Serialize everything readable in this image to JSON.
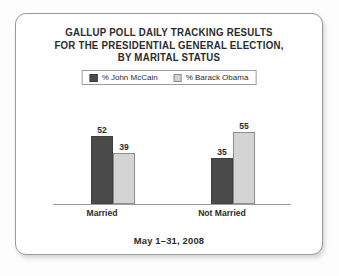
{
  "chart_data": {
    "type": "bar",
    "title": "GALLUP POLL DAILY TRACKING RESULTS FOR THE PRESIDENTIAL GENERAL ELECTION, BY MARITAL STATUS",
    "title_lines": [
      "GALLUP POLL DAILY TRACKING RESULTS",
      "FOR THE PRESIDENTIAL GENERAL ELECTION,",
      "BY MARITAL STATUS"
    ],
    "subtitle": "May 1–31, 2008",
    "categories": [
      "Married",
      "Not Married"
    ],
    "series": [
      {
        "name": "% John McCain",
        "values": [
          52,
          39
        ],
        "color": "#4a4a4a"
      },
      {
        "name": "% Barack Obama",
        "values": [
          39,
          55
        ],
        "color": "#d4d4d4"
      }
    ],
    "series_display": [
      {
        "name": "% John McCain",
        "color": "#4a4a4a"
      },
      {
        "name": "% Barack Obama",
        "color": "#d4d4d4"
      }
    ],
    "bars": [
      {
        "group": "Married",
        "series": "% John McCain",
        "value": 52
      },
      {
        "group": "Married",
        "series": "% Barack Obama",
        "value": 39
      },
      {
        "group": "Not Married",
        "series": "% John McCain",
        "value": 35
      },
      {
        "group": "Not Married",
        "series": "% Barack Obama",
        "value": 55
      }
    ],
    "values_flat": [
      52,
      39,
      35,
      55
    ],
    "xlabel": "",
    "ylabel": "",
    "ylim": [
      0,
      60
    ],
    "grid": false,
    "legend_position": "top-center",
    "axis_line": true,
    "data_labels": true,
    "unit": "percent"
  },
  "legend": {
    "entries": [
      {
        "label": "% John McCain",
        "swatch": "mccain-swatch"
      },
      {
        "label": "% Barack Obama",
        "swatch": "obama-swatch"
      }
    ]
  },
  "footer": {
    "caption": "May 1–31, 2008"
  },
  "colors": {
    "mccain": "#4a4a4a",
    "obama": "#d4d4d4",
    "text": "#2b2b2b",
    "axis": "#9e9e9e",
    "card_border": "#9a9a9a",
    "page_background": "#fdfdfd"
  }
}
